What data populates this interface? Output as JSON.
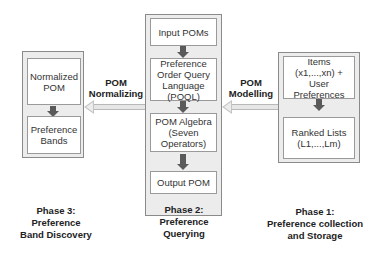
{
  "phase3": {
    "boxes": [
      "Normalized POM",
      "Preference Bands"
    ],
    "caption": [
      "Phase 3:",
      "Preference",
      "Band Discovery"
    ]
  },
  "phase2": {
    "boxes": [
      "Input POMs",
      "Preference Order Query Language (POQL)",
      "POM Algebra (Seven Operators)",
      "Output POM"
    ],
    "caption": [
      "Phase 2:",
      "Preference",
      "Querying"
    ]
  },
  "phase1": {
    "boxes": [
      "Items (x1,...,xn) + User Preferences",
      "Ranked Lists (L1,...,Lm)"
    ],
    "caption": [
      "Phase 1:",
      "Preference collection",
      "and Storage"
    ]
  },
  "arrows": {
    "left": [
      "POM",
      "Normalizing"
    ],
    "right": [
      "POM",
      "Modelling"
    ]
  },
  "colors": {
    "outer_fill": "#ececec",
    "inner_fill": "#ffffff",
    "arrow_dark": "#5a5a5a",
    "arrow_light": "#e6e6e6"
  }
}
